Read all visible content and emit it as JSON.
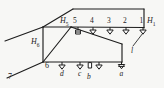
{
  "diagram": {
    "type": "isometric-piping-schematic",
    "colors": {
      "line": "#1d1d1d",
      "background": "#f7f7f5",
      "text": "#1d1d1d"
    },
    "head_labels": [
      {
        "id": "H5",
        "text": "H",
        "sub": "5"
      },
      {
        "id": "H6",
        "text": "H",
        "sub": "6"
      },
      {
        "id": "H1",
        "text": "H",
        "sub": "1"
      }
    ],
    "upper_nodes": [
      {
        "label": "5"
      },
      {
        "label": "4"
      },
      {
        "label": "3"
      },
      {
        "label": "2"
      },
      {
        "label": "1"
      }
    ],
    "lower_nodes": [
      {
        "label": "6"
      }
    ],
    "branch_labels": [
      {
        "label": "d"
      },
      {
        "label": "c"
      },
      {
        "label": "b"
      },
      {
        "label": "a"
      }
    ],
    "segment_labels": [
      {
        "label": "7"
      },
      {
        "label": "l"
      }
    ]
  }
}
